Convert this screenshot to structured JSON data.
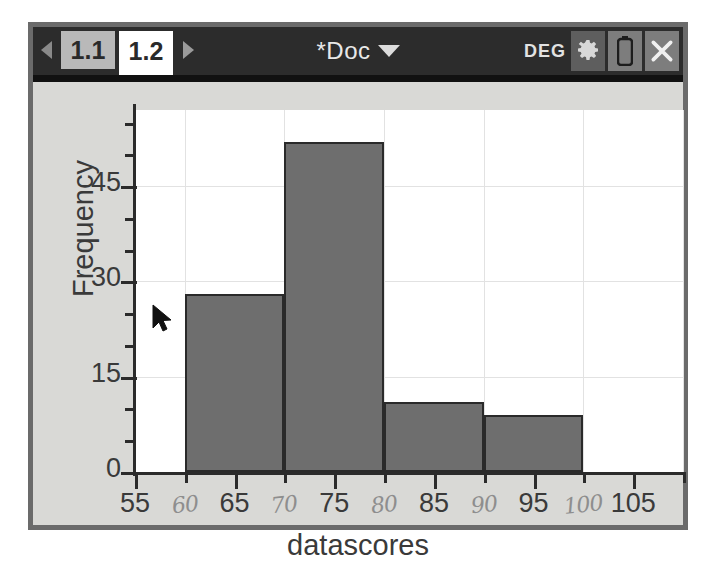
{
  "header": {
    "tabs": [
      {
        "label": "1.1",
        "active": false
      },
      {
        "label": "1.2",
        "active": true
      }
    ],
    "prev_arrow_icon": "chevron-left-icon",
    "next_arrow_icon": "chevron-right-icon",
    "document_title": "*Doc",
    "document_chevron_icon": "chevron-down-icon",
    "angle_mode": "DEG",
    "settings_icon": "gear-icon",
    "battery_icon": "battery-icon",
    "close_icon": "close-icon"
  },
  "colors": {
    "header_bg": "#2c2c2c",
    "page_bg": "#d9d9d6",
    "plot_bg": "#ffffff",
    "bar_fill": "#6e6e6e",
    "bar_stroke": "#2a2a2a",
    "grid": "#e2e2e2",
    "axis": "#2b2b2b",
    "printed_label": "#3a3a3a",
    "handwritten_label": "#8e8e8e",
    "frame": "#6b6b6b"
  },
  "cursor": {
    "icon": "mouse-pointer-icon",
    "x": 125,
    "y": 252
  },
  "chart_data": {
    "type": "bar",
    "title": "",
    "xlabel": "datascores",
    "ylabel": "Frequency",
    "xlim": [
      55,
      110
    ],
    "ylim": [
      0,
      57
    ],
    "grid": true,
    "legend": "none",
    "bin_width": 10,
    "bins": [
      {
        "start": 60,
        "end": 70,
        "value": 28
      },
      {
        "start": 70,
        "end": 80,
        "value": 52
      },
      {
        "start": 80,
        "end": 90,
        "value": 11
      },
      {
        "start": 90,
        "end": 100,
        "value": 9
      }
    ],
    "categories": [
      "60-70",
      "70-80",
      "80-90",
      "90-100"
    ],
    "values": [
      28,
      52,
      11,
      9
    ],
    "y_ticks": [
      0,
      15,
      30,
      45
    ],
    "y_minor_tick_step": 5,
    "x_ticks_printed": [
      55,
      65,
      75,
      85,
      95,
      105
    ],
    "x_ticks_handwritten": [
      60,
      70,
      80,
      90,
      100
    ],
    "x_tick_step": 5,
    "x_labels": [
      {
        "text": "55",
        "value": 55,
        "handwritten": false
      },
      {
        "text": "60",
        "value": 60,
        "handwritten": true
      },
      {
        "text": "65",
        "value": 65,
        "handwritten": false
      },
      {
        "text": "70",
        "value": 70,
        "handwritten": true
      },
      {
        "text": "75",
        "value": 75,
        "handwritten": false
      },
      {
        "text": "80",
        "value": 80,
        "handwritten": true
      },
      {
        "text": "85",
        "value": 85,
        "handwritten": false
      },
      {
        "text": "90",
        "value": 90,
        "handwritten": true
      },
      {
        "text": "95",
        "value": 95,
        "handwritten": false
      },
      {
        "text": "100",
        "value": 100,
        "handwritten": true
      },
      {
        "text": "105",
        "value": 105,
        "handwritten": false
      }
    ]
  }
}
